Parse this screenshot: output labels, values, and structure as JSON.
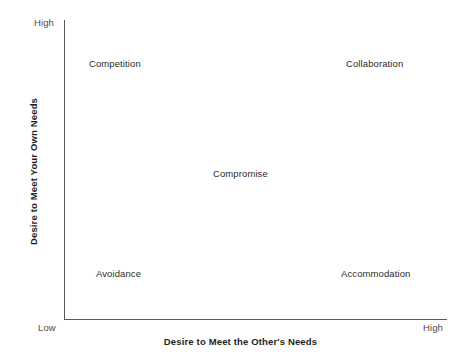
{
  "figure": {
    "axes": {
      "y": {
        "title": "Desire to Meet Your Own Needs",
        "low_label": "Low",
        "high_label": "High"
      },
      "x": {
        "title": "Desire to Meet the Other's Needs",
        "low_label": "Low",
        "high_label": "High"
      }
    },
    "nodes": [
      {
        "label": "Competition"
      },
      {
        "label": "Collaboration"
      },
      {
        "label": "Compromise"
      },
      {
        "label": "Avoidance"
      },
      {
        "label": "Accommodation"
      }
    ]
  }
}
